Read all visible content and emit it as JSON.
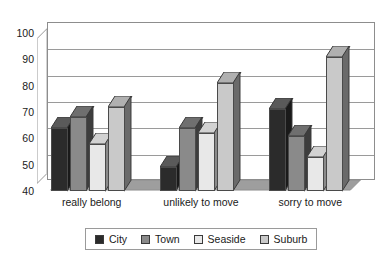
{
  "chart_data": {
    "type": "bar",
    "title": "",
    "subtitle": "",
    "xlabel": "",
    "ylabel": "",
    "ylim": [
      40,
      100
    ],
    "ytick_step": 10,
    "yticks": [
      40,
      50,
      60,
      70,
      80,
      90,
      100
    ],
    "ytick_labels": [
      "40",
      "50",
      "60",
      "70",
      "80",
      "90",
      "100"
    ],
    "grid": true,
    "grid_axis": "y",
    "legend_position": "bottom",
    "style": "3d-column",
    "categories": [
      "really belong",
      "unlikely to move",
      "sorry to move"
    ],
    "series": [
      {
        "name": "City",
        "color": "#2b2b2b",
        "top_color": "#5a5a5a",
        "side_color": "#1a1a1a",
        "values": [
          64,
          49,
          71
        ]
      },
      {
        "name": "Town",
        "color": "#8a8a8a",
        "top_color": "#6f6f6f",
        "side_color": "#3d3d3d",
        "values": [
          68,
          64,
          61
        ]
      },
      {
        "name": "Seaside",
        "color": "#e8e8e8",
        "top_color": "#d2d2d2",
        "side_color": "#8a8a8a",
        "values": [
          58,
          62,
          53
        ]
      },
      {
        "name": "Suburb",
        "color": "#c9c9c9",
        "top_color": "#b0b0b0",
        "side_color": "#6a6a6a",
        "values": [
          72,
          81,
          91
        ]
      }
    ]
  },
  "axes": {
    "y_tick_labels": [
      "100",
      "90",
      "80",
      "70",
      "60",
      "50",
      "40"
    ],
    "x_tick_labels": [
      "really belong",
      "unlikely to move",
      "sorry to move"
    ]
  },
  "legend": {
    "entries": [
      {
        "label": "City"
      },
      {
        "label": "Town"
      },
      {
        "label": "Seaside"
      },
      {
        "label": "Suburb"
      }
    ]
  },
  "colors": {
    "axis_line": "#8d8d8d",
    "gridline": "#9a9a9a",
    "background": "#ffffff",
    "text": "#1a1a1a",
    "floor": "#9e9e9e",
    "side_wall": "#ffffff"
  }
}
